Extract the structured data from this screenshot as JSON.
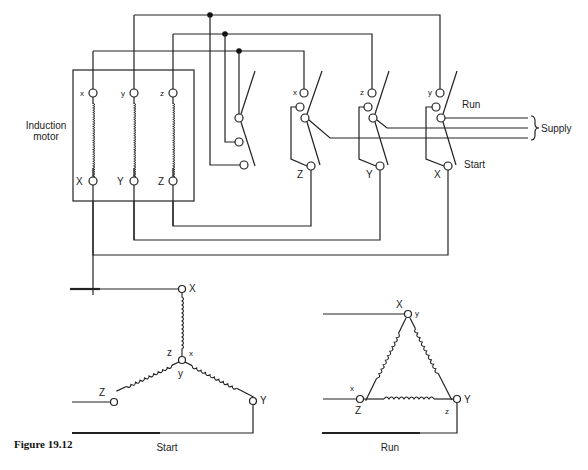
{
  "figure": {
    "caption": "Figure 19.12"
  },
  "motor": {
    "label_line1": "Induction",
    "label_line2": "motor",
    "terminals_top": [
      "x",
      "y",
      "z"
    ],
    "terminals_bottom": [
      "X",
      "Y",
      "Z"
    ]
  },
  "switches": {
    "run_label": "Run",
    "start_label": "Start",
    "supply_label": "Supply",
    "switch1": {
      "top": "x",
      "bottom": "Z"
    },
    "switch2": {
      "top": "z",
      "bottom": "Y"
    },
    "switch3": {
      "top": "y",
      "bottom": "X"
    }
  },
  "star": {
    "title": "Start",
    "labels": {
      "X": "X",
      "Y": "Y",
      "Z": "Z",
      "x": "x",
      "y": "y",
      "z": "z"
    }
  },
  "delta": {
    "title": "Run",
    "labels": {
      "X": "X",
      "Y": "Y",
      "Z": "Z",
      "x": "x",
      "y": "y",
      "z": "z"
    }
  }
}
